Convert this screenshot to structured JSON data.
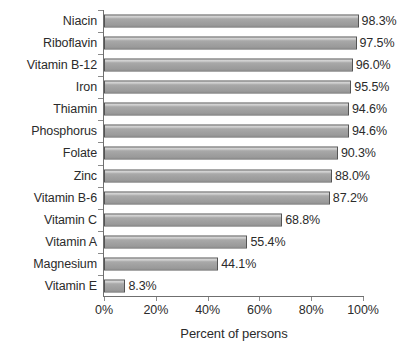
{
  "chart_data": {
    "type": "bar",
    "orientation": "horizontal",
    "title": "",
    "xlabel": "Percent of persons",
    "ylabel": "",
    "xlim": [
      0,
      100
    ],
    "xticks": [
      "0%",
      "20%",
      "40%",
      "60%",
      "80%",
      "100%"
    ],
    "xtick_values": [
      0,
      20,
      40,
      60,
      80,
      100
    ],
    "grid": false,
    "legend": null,
    "categories": [
      "Niacin",
      "Riboflavin",
      "Vitamin B-12",
      "Iron",
      "Thiamin",
      "Phosphorus",
      "Folate",
      "Zinc",
      "Vitamin B-6",
      "Vitamin C",
      "Vitamin A",
      "Magnesium",
      "Vitamin E"
    ],
    "values": [
      98.3,
      97.5,
      96.0,
      95.5,
      94.6,
      94.6,
      90.3,
      88.0,
      87.2,
      68.8,
      55.4,
      44.1,
      8.3
    ],
    "data_labels": [
      "98.3%",
      "97.5%",
      "96.0%",
      "95.5%",
      "94.6%",
      "94.6%",
      "90.3%",
      "88.0%",
      "87.2%",
      "68.8%",
      "55.4%",
      "44.1%",
      "8.3%"
    ],
    "colors": {
      "bar_fill_light": "#d6d6d6",
      "bar_fill_dark": "#9a9a9a",
      "bar_border": "#545454",
      "axis": "#6f6f6f",
      "text": "#2b2b2b",
      "background": "#ffffff"
    }
  }
}
